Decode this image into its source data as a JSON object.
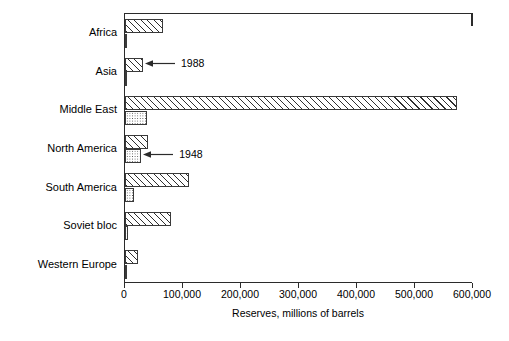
{
  "chart_data": {
    "type": "bar",
    "orientation": "horizontal",
    "title": "",
    "xlabel": "Reserves, millions of barrels",
    "ylabel": "World region",
    "xlim": [
      0,
      600000
    ],
    "xticks": [
      0,
      100000,
      200000,
      300000,
      400000,
      500000,
      600000
    ],
    "xticklabels": [
      "0",
      "100,000",
      "200,000",
      "300,000",
      "400,000",
      "500,000",
      "600,000"
    ],
    "grid": false,
    "legend": "none",
    "categories": [
      "Africa",
      "Asia",
      "Middle East",
      "North America",
      "South America",
      "Soviet bloc",
      "Western Europe"
    ],
    "series": [
      {
        "name": "1988",
        "fill": "diagonal-hatch",
        "values": [
          65000,
          31000,
          572000,
          40000,
          110000,
          80000,
          22000
        ]
      },
      {
        "name": "1948",
        "fill": "dotted",
        "values": [
          1000,
          1000,
          38000,
          28000,
          16000,
          6000,
          1000
        ]
      }
    ],
    "annotations": [
      {
        "text": "1988",
        "points_to_category": "Asia",
        "points_to_series": "1988"
      },
      {
        "text": "1948",
        "points_to_category": "North America",
        "points_to_series": "1948"
      }
    ]
  }
}
